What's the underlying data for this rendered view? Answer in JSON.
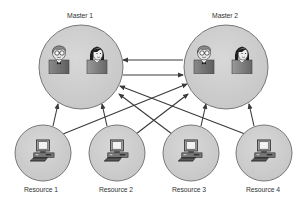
{
  "diagram": {
    "colors": {
      "circle_fill": "#cfcfcf",
      "circle_stroke": "#777777",
      "arrow": "#3a3a3a",
      "label": "#333333"
    },
    "masters": [
      {
        "id": "master1",
        "label": "Master 1",
        "cx": 81,
        "cy": 67,
        "r": 42,
        "label_x": 80,
        "label_y": 11,
        "icons": [
          "man-with-glasses-icon",
          "woman-icon"
        ]
      },
      {
        "id": "master2",
        "label": "Master 2",
        "cx": 226,
        "cy": 67,
        "r": 42,
        "label_x": 225,
        "label_y": 11,
        "icons": [
          "man-with-glasses-icon",
          "woman-icon"
        ]
      }
    ],
    "resources": [
      {
        "id": "resource1",
        "label": "Resource 1",
        "cx": 43,
        "cy": 153,
        "r": 28,
        "label_x": 41,
        "label_y": 185,
        "icon": "computer-icon"
      },
      {
        "id": "resource2",
        "label": "Resource 2",
        "cx": 117,
        "cy": 153,
        "r": 28,
        "label_x": 116,
        "label_y": 185,
        "icon": "computer-icon"
      },
      {
        "id": "resource3",
        "label": "Resource 3",
        "cx": 191,
        "cy": 153,
        "r": 28,
        "label_x": 189,
        "label_y": 185,
        "icon": "computer-icon"
      },
      {
        "id": "resource4",
        "label": "Resource 4",
        "cx": 264,
        "cy": 153,
        "r": 28,
        "label_x": 263,
        "label_y": 185,
        "icon": "computer-icon"
      }
    ],
    "edges": [
      {
        "from": "master2",
        "to": "master1",
        "x1": 183,
        "y1": 60,
        "x2": 123,
        "y2": 60
      },
      {
        "from": "master1",
        "to": "master2",
        "x1": 123,
        "y1": 75,
        "x2": 183,
        "y2": 75
      },
      {
        "from": "resource1",
        "to": "master1",
        "x1": 53,
        "y1": 126,
        "x2": 58,
        "y2": 104
      },
      {
        "from": "resource2",
        "to": "master1",
        "x1": 107,
        "y1": 126,
        "x2": 102,
        "y2": 104
      },
      {
        "from": "resource3",
        "to": "master2",
        "x1": 201,
        "y1": 126,
        "x2": 206,
        "y2": 104
      },
      {
        "from": "resource4",
        "to": "master2",
        "x1": 254,
        "y1": 126,
        "x2": 249,
        "y2": 104
      },
      {
        "from": "resource1",
        "to": "master2",
        "x1": 63,
        "y1": 134,
        "x2": 187,
        "y2": 84
      },
      {
        "from": "resource2",
        "to": "master2",
        "x1": 136,
        "y1": 134,
        "x2": 188,
        "y2": 94
      },
      {
        "from": "resource3",
        "to": "master1",
        "x1": 172,
        "y1": 134,
        "x2": 119,
        "y2": 94
      },
      {
        "from": "resource4",
        "to": "master1",
        "x1": 245,
        "y1": 134,
        "x2": 120,
        "y2": 86
      }
    ]
  }
}
